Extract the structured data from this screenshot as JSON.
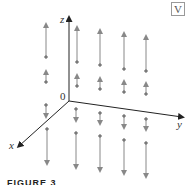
{
  "figure": {
    "caption": "FIGURE 3",
    "badge": "V",
    "axes": {
      "z_label": "z",
      "y_label": "y",
      "x_label": "x",
      "origin_label": "0"
    },
    "colors": {
      "axis": "#222222",
      "arrow": "#888888",
      "dot": "#666666"
    }
  }
}
